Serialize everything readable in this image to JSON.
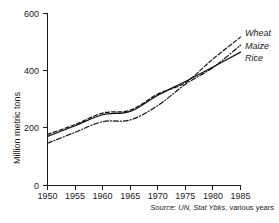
{
  "chart_data": {
    "type": "line",
    "title": "",
    "xlabel": "",
    "ylabel": "Million metric tons",
    "xlim": [
      1950,
      1985
    ],
    "ylim": [
      0,
      600
    ],
    "xticks": [
      1950,
      1955,
      1960,
      1965,
      1970,
      1975,
      1980,
      1985
    ],
    "yticks": [
      0,
      200,
      400,
      600
    ],
    "xtick_labels": [
      "1950",
      "1955",
      "1960",
      "1965",
      "1970",
      "1975",
      "1980",
      "1985"
    ],
    "ytick_labels": [
      "0",
      "200",
      "400",
      "600"
    ],
    "grid": false,
    "legend_position": "right-inline-end-of-line",
    "x": [
      1950,
      1955,
      1960,
      1965,
      1970,
      1975,
      1980,
      1985
    ],
    "series": [
      {
        "name": "Wheat",
        "label": "Wheat",
        "style": "dashed",
        "color": "#111111",
        "values": [
          178,
          212,
          252,
          262,
          318,
          358,
          440,
          516
        ]
      },
      {
        "name": "Maize",
        "label": "Maize",
        "style": "dashdot",
        "color": "#111111",
        "values": [
          147,
          185,
          222,
          228,
          278,
          352,
          410,
          488
        ]
      },
      {
        "name": "Rice",
        "label": "Rice",
        "style": "solid",
        "color": "#111111",
        "values": [
          171,
          208,
          246,
          258,
          314,
          362,
          412,
          464
        ]
      }
    ],
    "annotations": [
      {
        "name": "source-note",
        "text": "Source: UN, Stat Ybks, various years",
        "parts": [
          {
            "text": "Source:",
            "italic": true
          },
          {
            "text": " UN,",
            "italic": true
          },
          {
            "text": " Stat Ybks",
            "italic": true
          },
          {
            "text": ", various years",
            "italic": false
          }
        ]
      }
    ]
  },
  "axes": {
    "y_axis_title": "Million metric tons",
    "y_tick_600": "600",
    "y_tick_400": "400",
    "y_tick_200": "200",
    "y_tick_0": "0",
    "x_tick_1950": "1950",
    "x_tick_1955": "1955",
    "x_tick_1960": "1960",
    "x_tick_1965": "1965",
    "x_tick_1970": "1970",
    "x_tick_1975": "1975",
    "x_tick_1980": "1980",
    "x_tick_1985": "1985"
  },
  "legend": {
    "wheat": "Wheat",
    "maize": "Maize",
    "rice": "Rice"
  },
  "source": {
    "prefix": "Source:",
    "pub": " UN,",
    "title": " Stat Ybks",
    "suffix": ", various years"
  }
}
